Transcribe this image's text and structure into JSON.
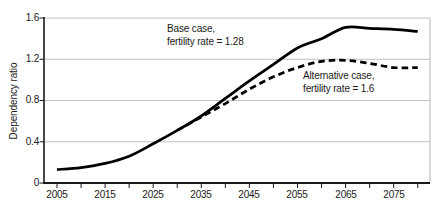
{
  "colors": {
    "line": "#000000",
    "grid": "#c0c0c0",
    "plot_border": "#b5b5b5",
    "axis": "#1a1a1a",
    "text": "#1a1a1a",
    "background": "#ffffff"
  },
  "chart_data": {
    "type": "line",
    "title": "",
    "xlabel": "",
    "ylabel": "Dependency ratio",
    "ylim": [
      0,
      1.6
    ],
    "xlim": [
      2002,
      2083
    ],
    "grid": "horizontal gridlines at every 0.4, light gray",
    "legend_position": "none (direct annotations next to lines)",
    "ytick_values": [
      0,
      0.4,
      0.8,
      1.2,
      1.6
    ],
    "ytick_labels": [
      "0",
      "0.4",
      "0.8",
      "1.2",
      "1.6"
    ],
    "xtick_label_values": [
      2005,
      2015,
      2025,
      2035,
      2045,
      2055,
      2065,
      2075
    ],
    "xtick_labels": [
      "2005",
      "2015",
      "2025",
      "2035",
      "2045",
      "2055",
      "2065",
      "2075"
    ],
    "minor_xtick_interval_years": 5,
    "series": [
      {
        "name": "Base case",
        "label": "Base case, fertility rate = 1.28",
        "line_style": "solid",
        "color": "#000000",
        "x": [
          2005,
          2010,
          2015,
          2020,
          2025,
          2030,
          2035,
          2040,
          2045,
          2050,
          2055,
          2060,
          2065,
          2070,
          2075,
          2080
        ],
        "values": [
          0.13,
          0.15,
          0.19,
          0.26,
          0.38,
          0.51,
          0.65,
          0.82,
          0.99,
          1.15,
          1.31,
          1.4,
          1.51,
          1.5,
          1.49,
          1.47
        ]
      },
      {
        "name": "Alternative case",
        "label": "Alternative case, fertility rate = 1.6",
        "line_style": "dashed",
        "color": "#000000",
        "x": [
          2030,
          2035,
          2040,
          2045,
          2050,
          2055,
          2060,
          2065,
          2070,
          2075,
          2080
        ],
        "values": [
          0.51,
          0.64,
          0.77,
          0.91,
          1.03,
          1.12,
          1.18,
          1.19,
          1.16,
          1.12,
          1.12
        ]
      }
    ],
    "annotations": {
      "base_case": {
        "line1": "Base case,",
        "line2": "fertility rate = 1.28"
      },
      "alt_case": {
        "line1": "Alternative case,",
        "line2": "fertility rate = 1.6"
      }
    }
  }
}
